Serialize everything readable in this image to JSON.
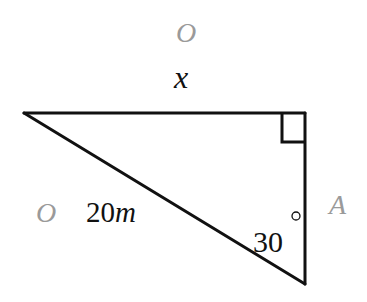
{
  "diagram": {
    "type": "right-triangle",
    "colors": {
      "stroke": "#111111",
      "label": "#111111",
      "ghost_label": "#9a9a9a"
    },
    "labels": {
      "opposite_ghost_top": "O",
      "adjacent_side": "x",
      "opposite_ghost_left": "O",
      "hypotenuse_value": "20",
      "hypotenuse_unit": "m",
      "side_ghost_right": "A",
      "angle_value": "30",
      "angle_degree_symbol": "°"
    },
    "angle": {
      "value_degrees": 30,
      "vertex": "bottom"
    },
    "right_angle_marker": {
      "vertex": "top-right"
    },
    "hypotenuse": {
      "length": 20,
      "unit": "m"
    }
  }
}
